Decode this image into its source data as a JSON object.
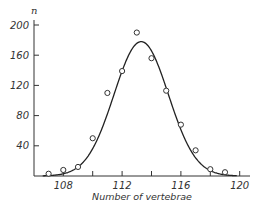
{
  "chart_data": {
    "type": "scatter",
    "title": "",
    "xlabel": "Number of vertebrae",
    "ylabel": "n",
    "xlim": [
      106.5,
      120.5
    ],
    "ylim": [
      0,
      205
    ],
    "x_ticks": [
      108,
      110,
      112,
      114,
      116,
      118,
      120
    ],
    "x_tick_labels": [
      "108",
      "112",
      "116",
      "120"
    ],
    "y_ticks": [
      40,
      80,
      120,
      160,
      200
    ],
    "y_tick_labels": [
      "40",
      "80",
      "120",
      "160",
      "200"
    ],
    "grid": false,
    "legend": null,
    "series": [
      {
        "name": "observed",
        "kind": "points",
        "marker": "open-circle",
        "x": [
          107,
          108,
          109,
          110,
          111,
          112,
          113,
          114,
          115,
          116,
          117,
          118,
          119
        ],
        "values": [
          3,
          8,
          12,
          50,
          110,
          139,
          190,
          156,
          113,
          68,
          34,
          9,
          5
        ]
      },
      {
        "name": "fitted normal curve",
        "kind": "line",
        "mean": 113.3,
        "sd": 1.85,
        "peak": 178
      }
    ]
  }
}
